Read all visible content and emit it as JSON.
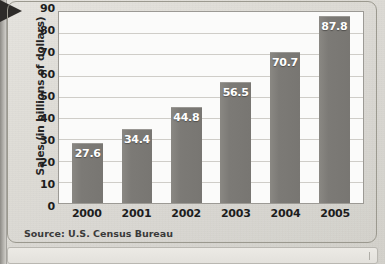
{
  "page": {
    "background_color": "#ddd9d4",
    "frame_color": "#9b998f",
    "binding_label": "book-binding-edge"
  },
  "chart_data": {
    "type": "bar",
    "title": "",
    "xlabel": "",
    "ylabel": "Sales (in billions of dollars)",
    "categories": [
      "2000",
      "2001",
      "2002",
      "2003",
      "2004",
      "2005"
    ],
    "values": [
      27.6,
      34.4,
      44.8,
      56.5,
      70.7,
      87.8
    ],
    "value_labels": [
      "27.6",
      "34.4",
      "44.8",
      "56.5",
      "70.7",
      "87.8"
    ],
    "ylim": [
      0,
      90
    ],
    "yticks": [
      90,
      80,
      70,
      60,
      50,
      40,
      30,
      20,
      10,
      0
    ],
    "ytick_labels": [
      "90",
      "80",
      "70",
      "60",
      "50",
      "40",
      "30",
      "20",
      "10",
      "0"
    ],
    "grid": true,
    "grid_axis": "y",
    "legend": null,
    "bar_color": "#7c7a76",
    "value_label_color": "#ffffff",
    "plot_background": "#fbfbfa",
    "gridline_color": "#cfcdc8"
  },
  "source": {
    "text": "Source: U.S. Census Bureau"
  }
}
